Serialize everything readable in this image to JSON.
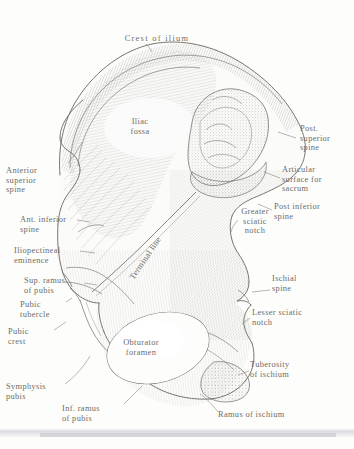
{
  "plate": {
    "title": "Right hip bone (os coxae) — medial surface",
    "style": "vintage engraving, pen-and-ink hatching",
    "ink_color": "#77766f",
    "label_color": "#6d6c67",
    "paper_color": "#fdfdfc"
  },
  "labels": {
    "crest_of_ilium": "Crest of ilium",
    "iliac_fossa": "Iliac\nfossa",
    "anterior_superior_spine": "Anterior\nsuperior\nspine",
    "ant_inferior_spine": "Ant. inferior\nspine",
    "iliopectineal_eminence": "Iliopectineal\neminence",
    "terminal_line": "Terminal line",
    "sup_ramus_of_pubis": "Sup. ramus\nof pubis",
    "pubic_tubercle": "Pubic\ntubercle",
    "pubic_crest": "Pubic\ncrest",
    "symphysis_pubis": "Symphysis\npubis",
    "inf_ramus_of_pubis": "Inf. ramus\nof pubis",
    "obturator_foramen": "Obturator\nforamen",
    "ramus_of_ischium": "Ramus of ischium",
    "tuberosity_of_ischium": "Tuberosity\nof ischium",
    "lesser_sciatic_notch": "Lesser sciatic\nnotch",
    "ischial_spine": "Ischial\nspine",
    "greater_sciatic_notch": "Greater\nsciatic\nnotch",
    "post_inferior_spine": "Post inferior\nspine",
    "articular_surface_for_sacrum": "Articular\nsurface for\nsacrum",
    "post_superior_spine": "Post.\nsuperior\nspine"
  }
}
